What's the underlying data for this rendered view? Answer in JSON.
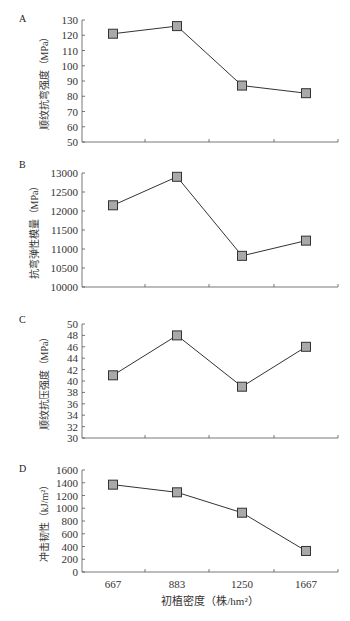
{
  "figure": {
    "x_axis": {
      "label": "初植密度（株/hm²）",
      "categories": [
        "667",
        "883",
        "1250",
        "1667"
      ]
    },
    "marker_color": "#a9a9a9",
    "line_color": "#333333"
  },
  "chart_data": [
    {
      "panel": "A",
      "type": "line",
      "title": "",
      "xlabel": "",
      "ylabel": "顺纹抗弯强度（MPa）",
      "categories": [
        "667",
        "883",
        "1250",
        "1667"
      ],
      "values": [
        121,
        126,
        87,
        82
      ],
      "ylim": [
        50,
        130
      ],
      "yticks": [
        50,
        60,
        70,
        80,
        90,
        100,
        110,
        120,
        130
      ],
      "grid": false,
      "legend": null
    },
    {
      "panel": "B",
      "type": "line",
      "title": "",
      "xlabel": "",
      "ylabel": "抗弯弹性模量（MPa）",
      "categories": [
        "667",
        "883",
        "1250",
        "1667"
      ],
      "values": [
        12150,
        12900,
        10820,
        11220
      ],
      "ylim": [
        10000,
        13000
      ],
      "yticks": [
        10000,
        10500,
        11000,
        11500,
        12000,
        12500,
        13000
      ],
      "grid": false,
      "legend": null
    },
    {
      "panel": "C",
      "type": "line",
      "title": "",
      "xlabel": "",
      "ylabel": "顺纹抗压强度（MPa）",
      "categories": [
        "667",
        "883",
        "1250",
        "1667"
      ],
      "values": [
        41,
        48,
        39,
        46
      ],
      "ylim": [
        30,
        50
      ],
      "yticks": [
        30,
        32,
        34,
        36,
        38,
        40,
        42,
        44,
        46,
        48,
        50
      ],
      "grid": false,
      "legend": null
    },
    {
      "panel": "D",
      "type": "line",
      "title": "",
      "xlabel": "初植密度（株/hm²）",
      "ylabel": "冲击韧性（kJ/m²）",
      "categories": [
        "667",
        "883",
        "1250",
        "1667"
      ],
      "values": [
        1370,
        1250,
        930,
        330
      ],
      "ylim": [
        0,
        1600
      ],
      "yticks": [
        0,
        200,
        400,
        600,
        800,
        1000,
        1200,
        1400,
        1600
      ],
      "grid": false,
      "legend": null
    }
  ]
}
